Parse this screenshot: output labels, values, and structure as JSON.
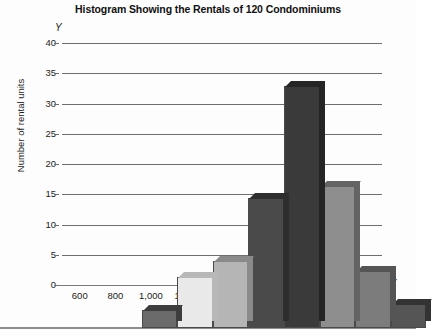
{
  "chart_data": {
    "type": "bar",
    "title": "Histogram Showing the Rentals of 120 Condominiums",
    "xlabel": "Monthly rentals (in dollars)",
    "ylabel": "Number of rental units",
    "x_axis_letter": "X",
    "y_axis_letter": "Y",
    "grid": true,
    "legend": "none",
    "xlim": [
      600,
      2200
    ],
    "ylim": [
      0,
      40
    ],
    "ytick_labels": [
      "40",
      "35",
      "30",
      "25",
      "20",
      "15",
      "10",
      "5",
      "0"
    ],
    "ytick_values": [
      40,
      35,
      30,
      25,
      20,
      15,
      10,
      5,
      0
    ],
    "xtick_labels": [
      "600",
      "800",
      "1,000",
      "1,200",
      "1,400",
      "1,600",
      "1,800",
      "2,000",
      "2,200"
    ],
    "xtick_values": [
      600,
      800,
      1000,
      1200,
      1400,
      1600,
      1800,
      2000,
      2200
    ],
    "bin_edges": [
      600,
      800,
      1000,
      1200,
      1400,
      1600,
      1800,
      2000,
      2200
    ],
    "categories": [
      "600-800",
      "800-1,000",
      "1,000-1,200",
      "1,200-1,400",
      "1,400-1,600",
      "1,600-1,800",
      "1,800-2,000",
      "2,000-2,200"
    ],
    "values": [
      3,
      8.5,
      11,
      21.5,
      40,
      23.5,
      9.5,
      4
    ],
    "bar_colors": [
      "#6b6b6b",
      "#e9e9e9",
      "#b5b5b5",
      "#4a4a4a",
      "#3a3a3a",
      "#8e8e8e",
      "#7c7c7c",
      "#555555"
    ],
    "bar_side_colors": [
      "#3d3d3d",
      "#b8b8b8",
      "#8a8a8a",
      "#2e2e2e",
      "#252525",
      "#646464",
      "#555555",
      "#333333"
    ],
    "total_label": "120"
  },
  "colors": {
    "grid": "#6f6f6f",
    "axis": "#7a7a7a",
    "text": "#1c1c1c",
    "background": "#fdfdfd"
  }
}
